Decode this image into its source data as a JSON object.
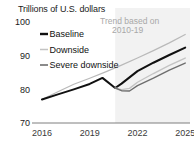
{
  "chart_data": {
    "type": "line",
    "title": "Trillions of U.S. dollars",
    "xlabel": "",
    "ylabel": "Trillions of U.S. dollars",
    "xlim": [
      2015.5,
      2025.3
    ],
    "ylim": [
      70,
      100
    ],
    "yticks": [
      70,
      80,
      90,
      100
    ],
    "ytick_labels": [
      "70",
      "80",
      "90",
      "100"
    ],
    "xticks": [
      2016,
      2019,
      2022,
      2025
    ],
    "xtick_labels": [
      "2016",
      "2019",
      "2022",
      "2025"
    ],
    "grid": false,
    "legend_position": "upper-left",
    "annotations": [
      {
        "name": "trend-annotation",
        "line1": "Trend based on",
        "line2": "2010-19",
        "color": "#b5b5b5"
      }
    ],
    "shaded_region": {
      "name": "forecast-shading",
      "x_start": 2020.6,
      "x_end": 2025.3,
      "color": "#f2f2f2"
    },
    "series": [
      {
        "name": "Trend based on 2010-19",
        "legend": false,
        "color": "#b9b9b9",
        "width": 1.2,
        "x": [
          2016,
          2017,
          2018,
          2019,
          2020,
          2021,
          2022,
          2023,
          2024,
          2025
        ],
        "y": [
          77.0,
          79.3,
          81.5,
          83.3,
          85.2,
          87.2,
          89.3,
          91.5,
          93.8,
          96.3
        ]
      },
      {
        "name": "Baseline",
        "legend": true,
        "color": "#111111",
        "width": 2.0,
        "x": [
          2016,
          2017,
          2018,
          2019,
          2019.8,
          2020.6,
          2021,
          2022,
          2023,
          2024,
          2025
        ],
        "y": [
          77.0,
          78.5,
          80.0,
          81.6,
          83.4,
          80.4,
          81.7,
          85.4,
          87.9,
          90.2,
          92.4
        ]
      },
      {
        "name": "Downside",
        "legend": true,
        "color": "#c3c3c3",
        "width": 1.4,
        "x": [
          2020.6,
          2021,
          2021.5,
          2022,
          2023,
          2024,
          2025
        ],
        "y": [
          80.4,
          79.9,
          80.3,
          82.1,
          84.7,
          87.1,
          89.3
        ]
      },
      {
        "name": "Severe downside",
        "legend": true,
        "color": "#6e6e6e",
        "width": 1.4,
        "x": [
          2020.6,
          2021,
          2021.5,
          2022,
          2023,
          2024,
          2025
        ],
        "y": [
          80.4,
          79.6,
          79.5,
          81.1,
          83.3,
          85.7,
          87.8
        ]
      }
    ],
    "legend_items": [
      {
        "label": "Baseline",
        "color": "#111111",
        "width": 2.4
      },
      {
        "label": "Downside",
        "color": "#c3c3c3",
        "width": 1.5
      },
      {
        "label": "Severe downside",
        "color": "#6e6e6e",
        "width": 1.6
      }
    ]
  }
}
